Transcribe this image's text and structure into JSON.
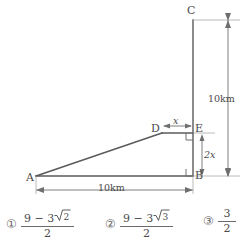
{
  "figure": {
    "type": "geometry-diagram",
    "points": [
      {
        "id": "A",
        "label": "A",
        "x": 36,
        "y": 176
      },
      {
        "id": "B",
        "label": "B",
        "x": 193,
        "y": 176
      },
      {
        "id": "C",
        "label": "C",
        "x": 193,
        "y": 20
      },
      {
        "id": "D",
        "label": "D",
        "x": 162,
        "y": 133
      },
      {
        "id": "E",
        "label": "E",
        "x": 193,
        "y": 133
      }
    ],
    "segments": [
      {
        "name": "segment-CB",
        "from": "C",
        "to": "B"
      },
      {
        "name": "segment-AB",
        "from": "A",
        "to": "B"
      },
      {
        "name": "segment-AD",
        "from": "A",
        "to": "D"
      },
      {
        "name": "segment-DE",
        "from": "D",
        "to": "E"
      }
    ],
    "right_angles": [
      {
        "name": "right-angle-at-E",
        "at": "E"
      },
      {
        "name": "right-angle-at-B",
        "at": "B"
      }
    ],
    "dimensions": [
      {
        "name": "vertical-10km",
        "label": "10km",
        "from": "C",
        "to": "B",
        "orientation": "vertical"
      },
      {
        "name": "horizontal-10km",
        "label": "10km",
        "from": "A",
        "to": "B",
        "orientation": "horizontal"
      },
      {
        "name": "segment-x",
        "label": "x",
        "from": "D",
        "to": "E",
        "orientation": "horizontal"
      },
      {
        "name": "segment-2x",
        "label": "2x",
        "from": "E",
        "to": "B",
        "orientation": "vertical"
      }
    ],
    "line_color": "#5a5a5a",
    "dim_color": "#7a7a7a",
    "text_color": "#4a4a4a"
  },
  "options": [
    {
      "marker": "①",
      "numerator_prefix": "9 − 3",
      "numerator_radicand": "2",
      "denominator": "2",
      "has_radical": true
    },
    {
      "marker": "②",
      "numerator_prefix": "9 − 3",
      "numerator_radicand": "3",
      "denominator": "2",
      "has_radical": true
    },
    {
      "marker": "③",
      "numerator_prefix": "3",
      "numerator_radicand": "",
      "denominator": "2",
      "has_radical": false
    }
  ]
}
